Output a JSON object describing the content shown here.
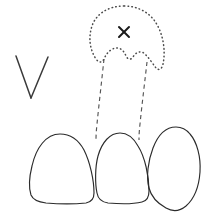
{
  "figure": {
    "background_color": "#ffffff",
    "width": 210,
    "height": 217,
    "ink_color": "#2b2b2b",
    "dotted_color": "#4a4a4a",
    "dashed_color": "#555555",
    "mark_color": "#1a1a1a"
  },
  "annotations": {
    "x_mark": {
      "label": "X",
      "meaning": "cross-mark-on-absent-tooth",
      "center_x": 124,
      "center_y": 32
    },
    "v_mark": {
      "label": "V",
      "meaning": "v-shaped-notation-mark",
      "apex_x": 31,
      "apex_y": 98
    }
  },
  "shapes": {
    "phantom_tooth": {
      "name": "dotted-tooth-outline",
      "style": "dotted",
      "crown_top_y": 6,
      "root_notch_y": 62
    },
    "roots": [
      {
        "name": "root-left",
        "style": "dashed"
      },
      {
        "name": "root-right",
        "style": "dashed"
      }
    ],
    "crowns": [
      {
        "name": "tooth-crown-left",
        "style": "solid"
      },
      {
        "name": "tooth-crown-center",
        "style": "solid"
      },
      {
        "name": "tooth-crown-right",
        "style": "solid"
      }
    ]
  },
  "paths": {
    "phantom_tooth_outline": "M 124 6 C 108 6 96 14 92 26 C 88 38 90 50 96 59 C 99 63 102 63 104 59 C 107 52 112 48 117 48 C 121 48 124 51 126 56 C 128 60 131 60 133 57 C 136 52 141 50 145 54 C 149 58 153 64 156 68 C 159 71 162 69 163 64 C 166 50 163 32 154 20 C 147 11 136 6 124 6 Z",
    "root_left": "M 104 59 C 102 78 99 104 97 124 C 96 133 96 138 96 141",
    "root_right": "M 147 62 C 145 80 142 104 140 124 C 139 133 139 137 139 140",
    "crown_left": "M 60 134 C 46 134 36 148 32 166 C 29 178 29 189 31 195 C 33 200 38 202 46 203 C 58 204 76 204 86 203 C 92 202 94 199 94 193 C 94 180 90 162 84 150 C 78 139 70 134 60 134 Z",
    "crown_center": "M 120 133 C 110 133 102 142 98 156 C 95 167 95 184 97 193 C 98 199 101 202 108 203 C 119 204 134 204 142 202 C 147 201 149 197 149 191 C 149 176 145 157 138 146 C 133 137 127 133 120 133 Z",
    "crown_right": "M 176 127 C 166 127 158 135 153 148 C 148 161 146 177 149 188 C 151 196 157 203 166 208 C 173 212 180 211 186 206 C 194 199 199 186 200 172 C 201 157 197 142 190 134 C 186 129 181 127 176 127 Z",
    "v_left": "M 16 56 L 31 98",
    "v_right": "M 48 57 L 31 98",
    "x_stroke_a": "M 119 27 L 129 37",
    "x_stroke_b": "M 129 27 L 119 37"
  }
}
